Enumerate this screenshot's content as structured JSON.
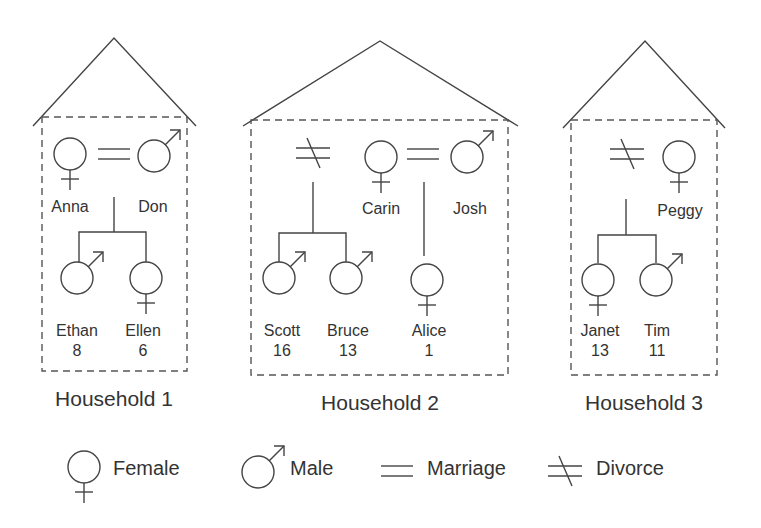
{
  "households": [
    {
      "title": "Household 1",
      "members": [
        {
          "name": "Anna",
          "sex": "female",
          "role": "parent"
        },
        {
          "name": "Don",
          "sex": "male",
          "role": "parent"
        },
        {
          "name": "Ethan",
          "age": "8",
          "sex": "male",
          "role": "child"
        },
        {
          "name": "Ellen",
          "age": "6",
          "sex": "female",
          "role": "child"
        }
      ],
      "relations": [
        {
          "type": "marriage",
          "between": [
            "Anna",
            "Don"
          ]
        },
        {
          "type": "children",
          "of": [
            "Anna",
            "Don"
          ],
          "children": [
            "Ethan",
            "Ellen"
          ]
        }
      ]
    },
    {
      "title": "Household 2",
      "members": [
        {
          "name": "Carin",
          "sex": "female",
          "role": "parent"
        },
        {
          "name": "Josh",
          "sex": "male",
          "role": "parent"
        },
        {
          "name": "Scott",
          "age": "16",
          "sex": "male",
          "role": "child"
        },
        {
          "name": "Bruce",
          "age": "13",
          "sex": "male",
          "role": "child"
        },
        {
          "name": "Alice",
          "age": "1",
          "sex": "female",
          "role": "child"
        }
      ],
      "relations": [
        {
          "type": "divorce",
          "children": [
            "Scott",
            "Bruce"
          ]
        },
        {
          "type": "marriage",
          "between": [
            "Carin",
            "Josh"
          ]
        },
        {
          "type": "children",
          "of": [
            "Carin",
            "Josh"
          ],
          "children": [
            "Alice"
          ]
        }
      ]
    },
    {
      "title": "Household 3",
      "members": [
        {
          "name": "Peggy",
          "sex": "female",
          "role": "parent"
        },
        {
          "name": "Janet",
          "age": "13",
          "sex": "female",
          "role": "child"
        },
        {
          "name": "Tim",
          "age": "11",
          "sex": "male",
          "role": "child"
        }
      ],
      "relations": [
        {
          "type": "divorce",
          "children": [
            "Janet",
            "Tim"
          ]
        }
      ]
    }
  ],
  "legend": [
    {
      "symbol": "female-symbol",
      "label": "Female"
    },
    {
      "symbol": "male-symbol",
      "label": "Male"
    },
    {
      "symbol": "marriage-symbol",
      "label": "Marriage"
    },
    {
      "symbol": "divorce-symbol",
      "label": "Divorce"
    }
  ],
  "colors": {
    "line": "#444444",
    "text": "#333333",
    "background": "#ffffff"
  }
}
